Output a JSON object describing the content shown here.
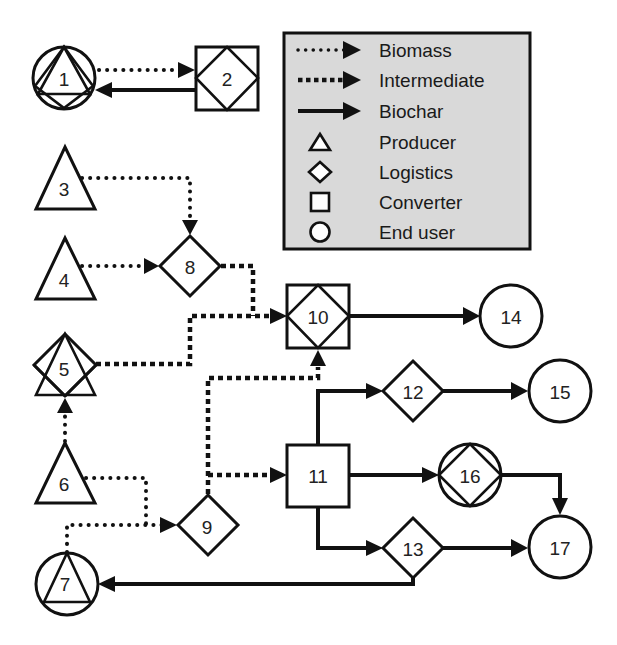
{
  "legend": {
    "background": "#d9d9d9",
    "flows": [
      {
        "label": "Biomass",
        "style": "dotted"
      },
      {
        "label": "Intermediate",
        "style": "dashed"
      },
      {
        "label": "Biochar",
        "style": "solid"
      }
    ],
    "roles": [
      {
        "label": "Producer",
        "shape": "triangle"
      },
      {
        "label": "Logistics",
        "shape": "diamond"
      },
      {
        "label": "Converter",
        "shape": "square"
      },
      {
        "label": "End user",
        "shape": "circle"
      }
    ]
  },
  "nodes": [
    {
      "id": "1",
      "label": "1",
      "roles": [
        "End user",
        "Producer",
        "Logistics"
      ]
    },
    {
      "id": "2",
      "label": "2",
      "roles": [
        "Converter",
        "Logistics"
      ]
    },
    {
      "id": "3",
      "label": "3",
      "roles": [
        "Producer"
      ]
    },
    {
      "id": "4",
      "label": "4",
      "roles": [
        "Producer"
      ]
    },
    {
      "id": "5",
      "label": "5",
      "roles": [
        "Producer",
        "Logistics"
      ]
    },
    {
      "id": "6",
      "label": "6",
      "roles": [
        "Producer"
      ]
    },
    {
      "id": "7",
      "label": "7",
      "roles": [
        "End user",
        "Producer"
      ]
    },
    {
      "id": "8",
      "label": "8",
      "roles": [
        "Logistics"
      ]
    },
    {
      "id": "9",
      "label": "9",
      "roles": [
        "Logistics"
      ]
    },
    {
      "id": "10",
      "label": "10",
      "roles": [
        "Converter",
        "Logistics"
      ]
    },
    {
      "id": "11",
      "label": "11",
      "roles": [
        "Converter"
      ]
    },
    {
      "id": "12",
      "label": "12",
      "roles": [
        "Logistics"
      ]
    },
    {
      "id": "13",
      "label": "13",
      "roles": [
        "Logistics"
      ]
    },
    {
      "id": "14",
      "label": "14",
      "roles": [
        "End user"
      ]
    },
    {
      "id": "15",
      "label": "15",
      "roles": [
        "End user"
      ]
    },
    {
      "id": "16",
      "label": "16",
      "roles": [
        "End user",
        "Logistics"
      ]
    },
    {
      "id": "17",
      "label": "17",
      "roles": [
        "End user"
      ]
    }
  ],
  "edges": [
    {
      "from": "1",
      "to": "2",
      "type": "Biomass"
    },
    {
      "from": "2",
      "to": "1",
      "type": "Biochar"
    },
    {
      "from": "3",
      "to": "8",
      "type": "Biomass"
    },
    {
      "from": "4",
      "to": "8",
      "type": "Biomass"
    },
    {
      "from": "8",
      "to": "10",
      "type": "Intermediate"
    },
    {
      "from": "5",
      "to": "10",
      "type": "Intermediate"
    },
    {
      "from": "6",
      "to": "5",
      "type": "Biomass"
    },
    {
      "from": "6",
      "to": "9",
      "type": "Biomass"
    },
    {
      "from": "7",
      "to": "9",
      "type": "Biomass"
    },
    {
      "from": "9",
      "to": "10",
      "type": "Intermediate"
    },
    {
      "from": "9",
      "to": "11",
      "type": "Intermediate"
    },
    {
      "from": "10",
      "to": "14",
      "type": "Biochar"
    },
    {
      "from": "11",
      "to": "12",
      "type": "Biochar"
    },
    {
      "from": "11",
      "to": "16",
      "type": "Biochar"
    },
    {
      "from": "11",
      "to": "13",
      "type": "Biochar"
    },
    {
      "from": "12",
      "to": "15",
      "type": "Biochar"
    },
    {
      "from": "16",
      "to": "17",
      "type": "Biochar"
    },
    {
      "from": "13",
      "to": "17",
      "type": "Biochar"
    },
    {
      "from": "13",
      "to": "7",
      "type": "Biochar"
    }
  ]
}
